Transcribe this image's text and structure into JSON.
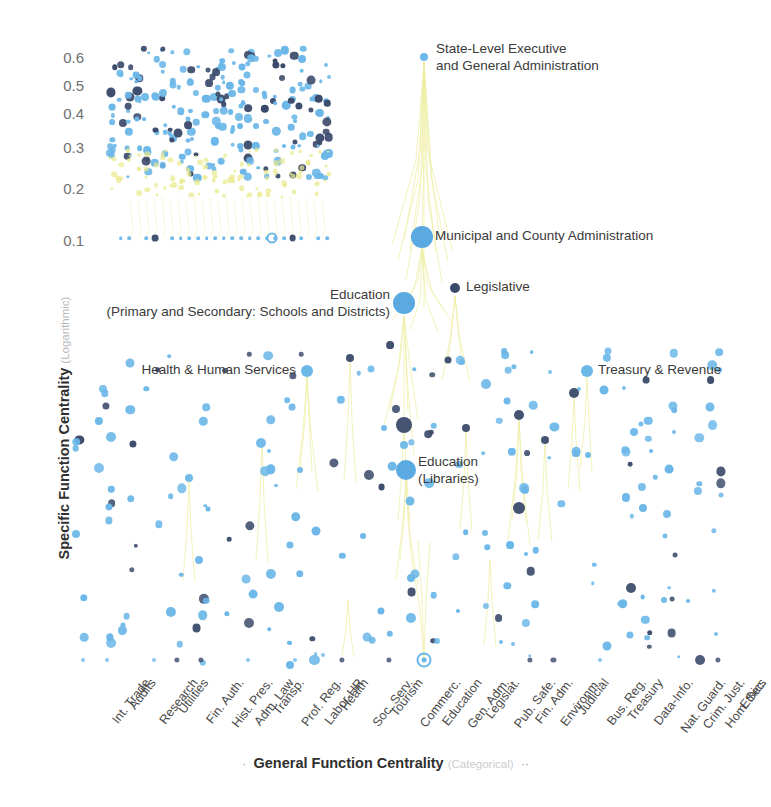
{
  "chart_data": {
    "type": "scatter",
    "title": "",
    "xlabel": "General Function Centrality",
    "xlabel_sub": "(Categorical)",
    "ylabel": "Specific Function Centrality",
    "ylabel_sub": "(Logarithmic)",
    "yticks": [
      "0.6",
      "0.5",
      "0.4",
      "0.3",
      "0.2",
      "0.1"
    ],
    "ytick_values": [
      0.6,
      0.5,
      0.4,
      0.3,
      0.2,
      0.1
    ],
    "ylim": [
      0.0,
      0.65
    ],
    "grid": false,
    "legend_position": "none",
    "yscale": "log",
    "xscale": "categorical",
    "categories": [
      "Int. Trade",
      "Audits",
      "Research",
      "Utilities",
      "Fin. Auth.",
      "Hist. Pres.",
      "Adm. Law",
      "Transp.",
      "Prof. Reg.",
      "Labor-HR",
      "Health",
      "Soc. Serv.",
      "Tourism",
      "Commerc.",
      "Education",
      "Gen. Adm.",
      "Legislat.",
      "Pub. Safe.",
      "Fin. Adm.",
      "Environm.",
      "Judicial",
      "Bus. Reg.",
      "Treasury",
      "Data-Info.",
      "Nat. Guard.",
      "Crim. Just.",
      "Hom. Sec.",
      "Ethics"
    ],
    "series": [
      {
        "name": "light-blue-nodes",
        "color": "#6bb7e8"
      },
      {
        "name": "dark-navy-nodes",
        "color": "#3b4a6b"
      },
      {
        "name": "yellow-edges",
        "color": "#eaea8c"
      }
    ],
    "annotations": [
      {
        "label_line1": "State-Level Executive",
        "label_line2": "and General Administration",
        "x": 436,
        "y": 57,
        "dot_x": 424,
        "dot_y": 57,
        "dot_r": 4,
        "color": "#6bb7e8",
        "align": "left"
      },
      {
        "label_line1": "Municipal and County Administration",
        "label_line2": "",
        "x": 435,
        "y": 237,
        "dot_x": 422,
        "dot_y": 237,
        "dot_r": 11,
        "color": "#5aa9e0",
        "align": "left"
      },
      {
        "label_line1": "Legislative",
        "label_line2": "",
        "x": 466,
        "y": 288,
        "dot_x": 455,
        "dot_y": 288,
        "dot_r": 5,
        "color": "#3b4a6b",
        "align": "left"
      },
      {
        "label_line1": "Education",
        "label_line2": "(Primary and Secondary: Schools and Districts)",
        "x": 390,
        "y": 303,
        "dot_x": 404,
        "dot_y": 303,
        "dot_r": 11,
        "color": "#5aa9e0",
        "align": "right"
      },
      {
        "label_line1": "Health & Human Services",
        "label_line2": "",
        "x": 296,
        "y": 371,
        "dot_x": 307,
        "dot_y": 371,
        "dot_r": 6,
        "color": "#6bb7e8",
        "align": "right"
      },
      {
        "label_line1": "Treasury & Revenue",
        "label_line2": "",
        "x": 598,
        "y": 371,
        "dot_x": 587,
        "dot_y": 371,
        "dot_r": 6,
        "color": "#6bb7e8",
        "align": "left"
      },
      {
        "label_line1": "Education",
        "label_line2": "(Libraries)",
        "x": 418,
        "y": 470,
        "dot_x": 406,
        "dot_y": 470,
        "dot_r": 10,
        "color": "#5aa9e0",
        "align": "left"
      }
    ]
  }
}
